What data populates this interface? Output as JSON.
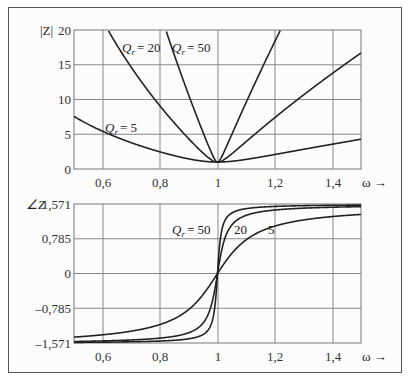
{
  "chart_data": [
    {
      "type": "line",
      "title": "",
      "ylabel": "|Z|",
      "xlabel": "ω →",
      "xlim": [
        0.5,
        1.5
      ],
      "ylim": [
        0,
        20
      ],
      "xticks": [
        0.6,
        0.8,
        1.0,
        1.2,
        1.4
      ],
      "xtick_labels": [
        "0,6",
        "0,8",
        "1",
        "1,2",
        "1,4"
      ],
      "yticks": [
        0,
        5,
        10,
        15,
        20
      ],
      "ytick_labels": [
        "0",
        "5",
        "10",
        "15",
        "20"
      ],
      "grid": true,
      "formula": "|Z| = sqrt(1 + Qr^2 (ω - 1/ω)^2)",
      "series": [
        {
          "name": "Qr = 5",
          "Q": 5,
          "x": [
            0.5,
            0.6,
            0.7,
            0.8,
            0.9,
            1.0,
            1.1,
            1.2,
            1.3,
            1.4,
            1.5
          ],
          "values": [
            7.57,
            5.43,
            3.6,
            2.46,
            1.48,
            1.0,
            1.4,
            2.03,
            2.69,
            3.33,
            3.97
          ]
        },
        {
          "name": "Qr = 20",
          "Q": 20,
          "x": [
            0.6,
            0.7,
            0.8,
            0.9,
            1.0,
            1.1,
            1.2,
            1.3,
            1.4,
            1.5
          ],
          "values": [
            21.4,
            14.3,
            9.06,
            4.33,
            1.0,
            3.95,
            7.4,
            10.6,
            13.8,
            16.7
          ]
        },
        {
          "name": "Qr = 50",
          "Q": 50,
          "x": [
            0.8,
            0.9,
            1.0,
            1.1,
            1.2
          ],
          "values": [
            22.5,
            10.6,
            1.0,
            9.6,
            18.3
          ]
        }
      ],
      "annotations": [
        {
          "text": "Qr = 20",
          "x": 0.72,
          "y": 18.5
        },
        {
          "text": "Qr = 50",
          "x": 0.89,
          "y": 18.5
        },
        {
          "text": "Qr = 5",
          "x": 0.6,
          "y": 6.0
        }
      ]
    },
    {
      "type": "line",
      "title": "",
      "ylabel": "∠Z",
      "xlabel": "ω →",
      "xlim": [
        0.5,
        1.5
      ],
      "ylim": [
        -1.571,
        1.571
      ],
      "xticks": [
        0.6,
        0.8,
        1.0,
        1.2,
        1.4
      ],
      "xtick_labels": [
        "0,6",
        "0,8",
        "1",
        "1,2",
        "1,4"
      ],
      "yticks": [
        -1.571,
        -0.785,
        0,
        0.785,
        1.571
      ],
      "ytick_labels": [
        "–1,571",
        "–0,785",
        "0",
        "0,785",
        "1,571"
      ],
      "grid": true,
      "formula": "∠Z = atan(Qr (ω - 1/ω))",
      "series": [
        {
          "name": "Qr = 5",
          "Q": 5,
          "x": [
            0.5,
            0.6,
            0.8,
            0.9,
            1.0,
            1.1,
            1.2,
            1.4,
            1.5
          ],
          "values": [
            -1.44,
            -1.38,
            -1.16,
            -0.81,
            0.0,
            0.76,
            1.07,
            1.27,
            1.32
          ]
        },
        {
          "name": "Qr = 20",
          "Q": 20,
          "x": [
            0.5,
            0.6,
            0.8,
            0.9,
            1.0,
            1.1,
            1.2,
            1.4,
            1.5
          ],
          "values": [
            -1.54,
            -1.52,
            -1.46,
            -1.34,
            0.0,
            1.32,
            1.44,
            1.5,
            1.52
          ]
        },
        {
          "name": "Qr = 50",
          "Q": 50,
          "x": [
            0.5,
            0.6,
            0.8,
            0.9,
            1.0,
            1.1,
            1.2,
            1.4,
            1.5
          ],
          "values": [
            -1.56,
            -1.55,
            -1.53,
            -1.48,
            0.0,
            1.48,
            1.53,
            1.55,
            1.56
          ]
        }
      ],
      "annotations": [
        {
          "text": "Qr = 50",
          "x": 0.85,
          "y": 0.9
        },
        {
          "text": "20",
          "x": 1.05,
          "y": 0.9
        },
        {
          "text": "5",
          "x": 1.19,
          "y": 0.9
        }
      ]
    }
  ],
  "top": {
    "ylabel": "|Z|",
    "xlabel": "ω →",
    "yticks": [
      "20",
      "15",
      "10",
      "5",
      "0"
    ],
    "xticks": [
      "0,6",
      "0,8",
      "1",
      "1,2",
      "1,4"
    ],
    "labels": {
      "q20": "= 20",
      "q50": "= 50",
      "q5": "= 5",
      "q": "Q",
      "sub": "r"
    }
  },
  "bottom": {
    "ylabel": "∠Z",
    "xlabel": "ω →",
    "yticks": [
      "1,571",
      "0,785",
      "0",
      "–0,785",
      "–1,571"
    ],
    "xticks": [
      "0,6",
      "0,8",
      "1",
      "1,2",
      "1,4"
    ],
    "labels": {
      "q50": "= 50",
      "q20": "20",
      "q5": "5",
      "q": "Q",
      "sub": "r"
    }
  }
}
